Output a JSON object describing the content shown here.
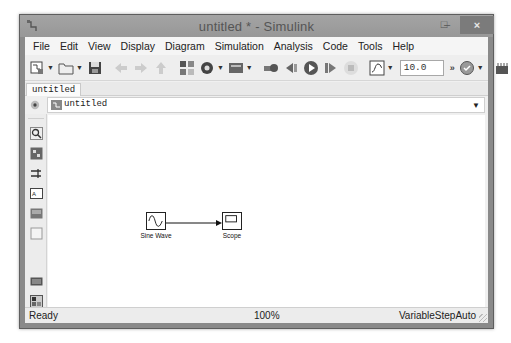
{
  "window": {
    "title": "untitled * - Simulink",
    "controls": {
      "minimize": "–",
      "maximize": "□",
      "close": "×"
    }
  },
  "menubar": {
    "items": [
      "File",
      "Edit",
      "View",
      "Display",
      "Diagram",
      "Simulation",
      "Analysis",
      "Code",
      "Tools",
      "Help"
    ]
  },
  "toolbar": {
    "buttons": [
      {
        "name": "new-model",
        "icon": "new-model-icon",
        "has_dropdown": true
      },
      {
        "name": "open",
        "icon": "folder-icon",
        "has_dropdown": true
      },
      {
        "name": "save",
        "icon": "floppy-icon",
        "has_dropdown": false
      },
      {
        "name": "back",
        "icon": "arrow-left-icon",
        "disabled": true
      },
      {
        "name": "forward",
        "icon": "arrow-right-icon",
        "disabled": true
      },
      {
        "name": "up",
        "icon": "arrow-up-icon",
        "disabled": true
      },
      {
        "name": "library-browser",
        "icon": "library-icon"
      },
      {
        "name": "model-config",
        "icon": "gear-icon",
        "has_dropdown": true
      },
      {
        "name": "model-explorer",
        "icon": "explorer-icon",
        "has_dropdown": true
      },
      {
        "name": "build",
        "icon": "build-icon"
      },
      {
        "name": "step-back",
        "icon": "step-back-icon"
      },
      {
        "name": "run",
        "icon": "play-icon"
      },
      {
        "name": "step-forward",
        "icon": "step-forward-icon"
      },
      {
        "name": "stop",
        "icon": "stop-icon",
        "disabled": true
      },
      {
        "name": "data-inspector",
        "icon": "signal-icon",
        "has_dropdown": true
      },
      {
        "name": "advisor",
        "icon": "advisor-icon",
        "has_dropdown": true
      },
      {
        "name": "hardware",
        "icon": "hardware-icon",
        "has_dropdown": true
      }
    ],
    "stop_time": "10.0",
    "overflow": "»"
  },
  "tabs": [
    {
      "label": "untitled",
      "active": true
    }
  ],
  "address_bar": {
    "path": "untitled"
  },
  "palette": {
    "items": [
      "zoom-icon",
      "fit-view-icon",
      "signal-routing-icon",
      "annotation-icon",
      "image-icon",
      "area-icon",
      "screenshot-icon",
      "model-browser-icon",
      "more-icon"
    ],
    "overflow": "»"
  },
  "canvas": {
    "blocks": [
      {
        "id": "sine",
        "label": "Sine Wave"
      },
      {
        "id": "scope",
        "label": "Scope"
      }
    ]
  },
  "statusbar": {
    "status": "Ready",
    "zoom": "100%",
    "solver": "VariableStepAuto"
  }
}
